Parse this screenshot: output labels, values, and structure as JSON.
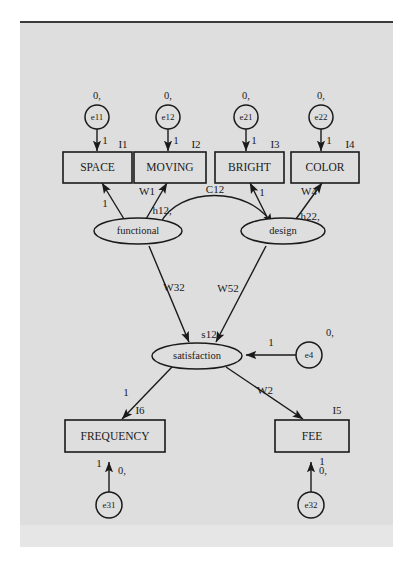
{
  "diagram": {
    "type": "path-diagram",
    "background_color": "#dedede",
    "line_color": "#1a1a1a",
    "observed_variables": [
      {
        "id": "space",
        "label": "SPACE",
        "index_label": "I1"
      },
      {
        "id": "moving",
        "label": "MOVING",
        "index_label": "I2"
      },
      {
        "id": "bright",
        "label": "BRIGHT",
        "index_label": "I3"
      },
      {
        "id": "color",
        "label": "COLOR",
        "index_label": "I4"
      },
      {
        "id": "frequency",
        "label": "FREQUENCY",
        "index_label": "I6"
      },
      {
        "id": "fee",
        "label": "FEE",
        "index_label": "I5"
      }
    ],
    "latent_variables": [
      {
        "id": "functional",
        "label": "functional",
        "intercept_label": "h12,"
      },
      {
        "id": "design",
        "label": "design",
        "intercept_label": "h22,"
      },
      {
        "id": "satisfaction",
        "label": "satisfaction",
        "intercept_label": "s12"
      }
    ],
    "error_terms": [
      {
        "id": "e11",
        "label": "e11",
        "mean_label": "0,",
        "loading": "1"
      },
      {
        "id": "e12",
        "label": "e12",
        "mean_label": "0,",
        "loading": "1"
      },
      {
        "id": "e21",
        "label": "e21",
        "mean_label": "0,",
        "loading": "1"
      },
      {
        "id": "e22",
        "label": "e22",
        "mean_label": "0,",
        "loading": "1"
      },
      {
        "id": "e31",
        "label": "e31",
        "mean_label": "0,",
        "loading": "1"
      },
      {
        "id": "e32",
        "label": "e32",
        "mean_label": "0,",
        "loading": "1"
      },
      {
        "id": "e4",
        "label": "e4",
        "mean_label": "0,",
        "loading": "1"
      }
    ],
    "path_labels": {
      "functional_to_space": "1",
      "functional_to_moving": "W1",
      "design_to_bright": "1",
      "design_to_color": "W4",
      "functional_design_covariance": "C12",
      "functional_to_satisfaction": "W32",
      "design_to_satisfaction": "W52",
      "satisfaction_to_frequency": "1",
      "satisfaction_to_fee": "W2"
    }
  }
}
